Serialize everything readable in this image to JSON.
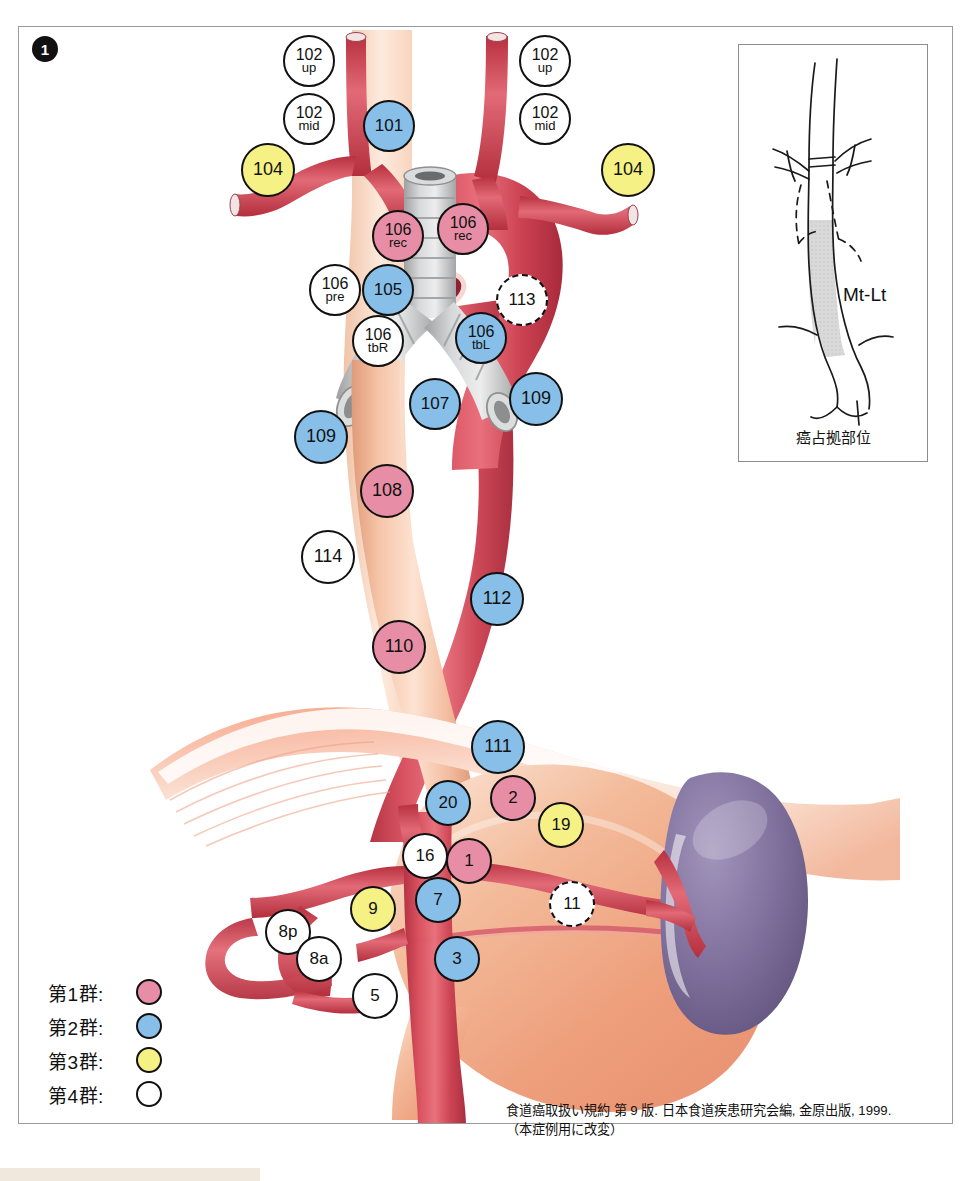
{
  "figure": {
    "number": "1",
    "title_alt": "Esophageal cancer lymph node station map"
  },
  "colors": {
    "group1_pink": "#e78ea6",
    "group2_blue": "#87bfe8",
    "group3_yellow": "#f6f184",
    "group4_white": "#ffffff",
    "outline": "#111111",
    "frame": "#9a9a9a",
    "artery_red": "#cf4050",
    "esophagus_tan": "#f0b59a",
    "stomach_peach": "#f2b393",
    "spleen_purple": "#7b6c98",
    "trachea_grey": "#c6c6c6",
    "diaphragm": "#ef9d86"
  },
  "nodes": [
    {
      "id": "102up-left",
      "l1": "102",
      "l2": "up",
      "group": "group4",
      "x": 283,
      "y": 35,
      "size": "n-md"
    },
    {
      "id": "102up-right",
      "l1": "102",
      "l2": "up",
      "group": "group4",
      "x": 519,
      "y": 35,
      "size": "n-md"
    },
    {
      "id": "102mid-left",
      "l1": "102",
      "l2": "mid",
      "group": "group4",
      "x": 283,
      "y": 93,
      "size": "n-md"
    },
    {
      "id": "102mid-right",
      "l1": "102",
      "l2": "mid",
      "group": "group4",
      "x": 519,
      "y": 93,
      "size": "n-md"
    },
    {
      "id": "101",
      "l1": "101",
      "l2": "",
      "group": "group2",
      "x": 363,
      "y": 100,
      "size": "n-md"
    },
    {
      "id": "104-left",
      "l1": "104",
      "l2": "",
      "group": "group3",
      "x": 241,
      "y": 143,
      "size": "n-lg"
    },
    {
      "id": "104-right",
      "l1": "104",
      "l2": "",
      "group": "group3",
      "x": 601,
      "y": 143,
      "size": "n-lg"
    },
    {
      "id": "106rec-left",
      "l1": "106",
      "l2": "rec",
      "group": "group1",
      "x": 372,
      "y": 210,
      "size": "n-md"
    },
    {
      "id": "106rec-right",
      "l1": "106",
      "l2": "rec",
      "group": "group1",
      "x": 437,
      "y": 203,
      "size": "n-md"
    },
    {
      "id": "106pre",
      "l1": "106",
      "l2": "pre",
      "group": "group4",
      "x": 309,
      "y": 264,
      "size": "n-md"
    },
    {
      "id": "105",
      "l1": "105",
      "l2": "",
      "group": "group2",
      "x": 362,
      "y": 264,
      "size": "n-md"
    },
    {
      "id": "113",
      "l1": "113",
      "l2": "",
      "group": "dashed",
      "x": 496,
      "y": 274,
      "size": "n-md"
    },
    {
      "id": "106tbR",
      "l1": "106",
      "l2": "tbR",
      "group": "group4",
      "x": 352,
      "y": 315,
      "size": "n-md"
    },
    {
      "id": "106tbL",
      "l1": "106",
      "l2": "tbL",
      "group": "group2",
      "x": 455,
      "y": 312,
      "size": "n-md"
    },
    {
      "id": "107",
      "l1": "107",
      "l2": "",
      "group": "group2",
      "x": 409,
      "y": 378,
      "size": "n-md"
    },
    {
      "id": "109-left",
      "l1": "109",
      "l2": "",
      "group": "group2",
      "x": 294,
      "y": 410,
      "size": "n-lg"
    },
    {
      "id": "109-right",
      "l1": "109",
      "l2": "",
      "group": "group2",
      "x": 509,
      "y": 372,
      "size": "n-lg"
    },
    {
      "id": "108",
      "l1": "108",
      "l2": "",
      "group": "group1",
      "x": 360,
      "y": 464,
      "size": "n-lg"
    },
    {
      "id": "114",
      "l1": "114",
      "l2": "",
      "group": "group4",
      "x": 301,
      "y": 530,
      "size": "n-lg"
    },
    {
      "id": "112",
      "l1": "112",
      "l2": "",
      "group": "group2",
      "x": 470,
      "y": 572,
      "size": "n-lg"
    },
    {
      "id": "110",
      "l1": "110",
      "l2": "",
      "group": "group1",
      "x": 372,
      "y": 620,
      "size": "n-lg"
    },
    {
      "id": "111",
      "l1": "111",
      "l2": "",
      "group": "group2",
      "x": 471,
      "y": 720,
      "size": "n-lg"
    },
    {
      "id": "20",
      "l1": "20",
      "l2": "",
      "group": "group2",
      "x": 425,
      "y": 780,
      "size": "n-sm"
    },
    {
      "id": "2",
      "l1": "2",
      "l2": "",
      "group": "group1",
      "x": 490,
      "y": 775,
      "size": "n-sm"
    },
    {
      "id": "19",
      "l1": "19",
      "l2": "",
      "group": "group3",
      "x": 538,
      "y": 802,
      "size": "n-sm"
    },
    {
      "id": "16",
      "l1": "16",
      "l2": "",
      "group": "group4",
      "x": 402,
      "y": 833,
      "size": "n-sm"
    },
    {
      "id": "1",
      "l1": "1",
      "l2": "",
      "group": "group1",
      "x": 446,
      "y": 838,
      "size": "n-sm"
    },
    {
      "id": "7",
      "l1": "7",
      "l2": "",
      "group": "group2",
      "x": 415,
      "y": 877,
      "size": "n-sm"
    },
    {
      "id": "9",
      "l1": "9",
      "l2": "",
      "group": "group3",
      "x": 350,
      "y": 886,
      "size": "n-sm"
    },
    {
      "id": "11",
      "l1": "11",
      "l2": "",
      "group": "dashed",
      "x": 549,
      "y": 881,
      "size": "n-sm"
    },
    {
      "id": "8p",
      "l1": "8p",
      "l2": "",
      "group": "group4",
      "x": 265,
      "y": 909,
      "size": "n-sm"
    },
    {
      "id": "8a",
      "l1": "8a",
      "l2": "",
      "group": "group4",
      "x": 296,
      "y": 936,
      "size": "n-sm"
    },
    {
      "id": "3",
      "l1": "3",
      "l2": "",
      "group": "group2",
      "x": 434,
      "y": 936,
      "size": "n-sm"
    },
    {
      "id": "5",
      "l1": "5",
      "l2": "",
      "group": "group4",
      "x": 352,
      "y": 973,
      "size": "n-sm"
    }
  ],
  "legend": {
    "rows": [
      {
        "label": "第1群:",
        "group": "group1"
      },
      {
        "label": "第2群:",
        "group": "group2"
      },
      {
        "label": "第3群:",
        "group": "group3"
      },
      {
        "label": "第4群:",
        "group": "group4"
      }
    ]
  },
  "citation": {
    "line1": "食道癌取扱い規約 第 9 版. 日本食道疾患研究会編, 金原出版, 1999.",
    "line2": "（本症例用に改変）"
  },
  "inset": {
    "label": "Mt-Lt",
    "caption": "癌占拠部位"
  }
}
